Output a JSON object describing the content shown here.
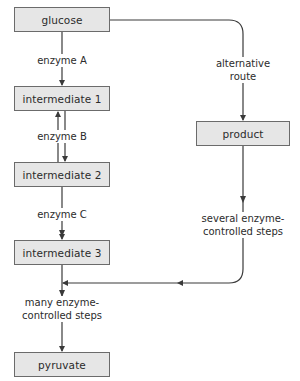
{
  "diagram": {
    "type": "flowchart",
    "colors": {
      "node_fill": "#e6e6e6",
      "node_border": "#6b6b6b",
      "line": "#3a3a3a",
      "text": "#2b2b2b"
    },
    "nodes": {
      "glucose": "glucose",
      "intermediate_1": "intermediate 1",
      "intermediate_2": "intermediate 2",
      "intermediate_3": "intermediate 3",
      "pyruvate": "pyruvate",
      "product": "product"
    },
    "edge_labels": {
      "enzyme_a": "enzyme A",
      "enzyme_b": "enzyme B",
      "enzyme_c": "enzyme C",
      "alternative_route_line1": "alternative",
      "alternative_route_line2": "route",
      "several_steps_line1": "several enzyme-",
      "several_steps_line2": "controlled steps",
      "many_steps_line1": "many enzyme-",
      "many_steps_line2": "controlled steps"
    },
    "edges": [
      {
        "from": "glucose",
        "to": "intermediate 1",
        "label": "enzyme A",
        "direction": "forward"
      },
      {
        "from": "intermediate 1",
        "to": "intermediate 2",
        "label": "enzyme B",
        "direction": "reversible"
      },
      {
        "from": "intermediate 2",
        "to": "intermediate 3",
        "label": "enzyme C",
        "direction": "forward"
      },
      {
        "from": "glucose",
        "to": "product",
        "label": "alternative route",
        "direction": "forward"
      },
      {
        "from": "product",
        "to": "main pathway (below intermediate 3)",
        "label": "several enzyme-controlled steps",
        "direction": "forward"
      },
      {
        "from": "intermediate 3",
        "to": "pyruvate",
        "label": "many enzyme-controlled steps",
        "direction": "forward"
      }
    ]
  }
}
